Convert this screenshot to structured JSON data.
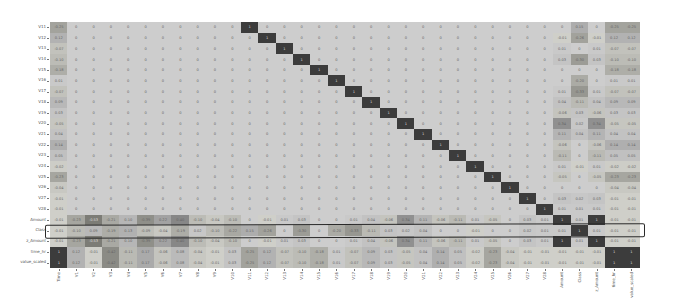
{
  "chart_data": {
    "type": "heatmap",
    "title": "",
    "xlabel": "",
    "ylabel": "",
    "columns": [
      "Time",
      "V1",
      "V2",
      "V3",
      "V4",
      "V5",
      "V6",
      "V7",
      "V8",
      "V9",
      "V10",
      "V11",
      "V12",
      "V13",
      "V14",
      "V15",
      "V16",
      "V17",
      "V18",
      "V19",
      "V20",
      "V21",
      "V22",
      "V23",
      "V24",
      "V25",
      "V26",
      "V27",
      "V28",
      "Amount",
      "Class",
      "z_Amount",
      "time_hr",
      "value_scaled"
    ],
    "rows": [
      "V11",
      "V12",
      "V13",
      "V14",
      "V15",
      "V16",
      "V17",
      "V18",
      "V19",
      "V20",
      "V21",
      "V22",
      "V23",
      "V24",
      "V25",
      "V26",
      "V27",
      "V28",
      "Amount",
      "Class",
      "z_Amount",
      "time_hr",
      "value_scaled"
    ],
    "values": [
      [
        -0.25,
        0,
        0,
        0,
        0,
        0,
        0,
        0,
        0,
        0,
        0,
        1,
        0,
        0,
        0,
        0,
        0,
        0,
        0,
        0,
        0,
        0,
        0,
        0,
        0,
        0,
        0,
        0,
        0,
        0.0,
        0.15,
        0.0,
        -0.25,
        -0.25
      ],
      [
        0.12,
        0,
        0,
        0,
        0,
        0,
        0,
        0,
        0,
        0,
        0,
        0,
        1,
        0,
        0,
        0,
        0,
        0,
        0,
        0,
        0,
        0,
        0,
        0,
        0,
        0,
        0,
        0,
        0,
        -0.01,
        -0.26,
        -0.01,
        0.12,
        0.12
      ],
      [
        -0.07,
        0,
        0,
        0,
        0,
        0,
        0,
        0,
        0,
        0,
        0,
        0,
        0,
        1,
        0,
        0,
        0,
        0,
        0,
        0,
        0,
        0,
        0,
        0,
        0,
        0,
        0,
        0,
        0,
        0.01,
        0.0,
        0.01,
        -0.07,
        -0.07
      ],
      [
        -0.1,
        0,
        0,
        0,
        0,
        0,
        0,
        0,
        0,
        0,
        0,
        0,
        0,
        0,
        1,
        0,
        0,
        0,
        0,
        0,
        0,
        0,
        0,
        0,
        0,
        0,
        0,
        0,
        0,
        0.03,
        -0.3,
        0.03,
        -0.1,
        -0.1
      ],
      [
        -0.18,
        0,
        0,
        0,
        0,
        0,
        0,
        0,
        0,
        0,
        0,
        0,
        0,
        0,
        0,
        1,
        0,
        0,
        0,
        0,
        0,
        0,
        0,
        0,
        0,
        0,
        0,
        0,
        0,
        0.0,
        0.0,
        0.0,
        -0.18,
        -0.18
      ],
      [
        0.01,
        0,
        0,
        0,
        0,
        0,
        0,
        0,
        0,
        0,
        0,
        0,
        0,
        0,
        0,
        0,
        1,
        0,
        0,
        0,
        0,
        0,
        0,
        0,
        0,
        0,
        0,
        0,
        0,
        0.0,
        -0.2,
        0.0,
        0.01,
        0.01
      ],
      [
        -0.07,
        0,
        0,
        0,
        0,
        0,
        0,
        0,
        0,
        0,
        0,
        0,
        0,
        0,
        0,
        0,
        0,
        1,
        0,
        0,
        0,
        0,
        0,
        0,
        0,
        0,
        0,
        0,
        0,
        0.01,
        -0.33,
        0.01,
        -0.07,
        -0.07
      ],
      [
        0.09,
        0,
        0,
        0,
        0,
        0,
        0,
        0,
        0,
        0,
        0,
        0,
        0,
        0,
        0,
        0,
        0,
        0,
        1,
        0,
        0,
        0,
        0,
        0,
        0,
        0,
        0,
        0,
        0,
        0.04,
        -0.11,
        0.04,
        0.09,
        0.09
      ],
      [
        0.03,
        0,
        0,
        0,
        0,
        0,
        0,
        0,
        0,
        0,
        0,
        0,
        0,
        0,
        0,
        0,
        0,
        0,
        0,
        1,
        0,
        0,
        0,
        0,
        0,
        0,
        0,
        0,
        0,
        -0.06,
        0.03,
        -0.06,
        0.03,
        0.03
      ],
      [
        -0.05,
        0,
        0,
        0,
        0,
        0,
        0,
        0,
        0,
        0,
        0,
        0,
        0,
        0,
        0,
        0,
        0,
        0,
        0,
        0,
        1,
        0,
        0,
        0,
        0,
        0,
        0,
        0,
        0,
        0.34,
        0.02,
        0.34,
        -0.05,
        -0.05
      ],
      [
        0.04,
        0,
        0,
        0,
        0,
        0,
        0,
        0,
        0,
        0,
        0,
        0,
        0,
        0,
        0,
        0,
        0,
        0,
        0,
        0,
        0,
        1,
        0,
        0,
        0,
        0,
        0,
        0,
        0,
        0.11,
        0.04,
        0.11,
        0.04,
        0.04
      ],
      [
        0.14,
        0,
        0,
        0,
        0,
        0,
        0,
        0,
        0,
        0,
        0,
        0,
        0,
        0,
        0,
        0,
        0,
        0,
        0,
        0,
        0,
        0,
        1,
        0,
        0,
        0,
        0,
        0,
        0,
        -0.06,
        0.0,
        -0.06,
        0.14,
        0.14
      ],
      [
        0.05,
        0,
        0,
        0,
        0,
        0,
        0,
        0,
        0,
        0,
        0,
        0,
        0,
        0,
        0,
        0,
        0,
        0,
        0,
        0,
        0,
        0,
        0,
        1,
        0,
        0,
        0,
        0,
        0,
        -0.11,
        0.0,
        -0.11,
        0.05,
        0.05
      ],
      [
        -0.02,
        0,
        0,
        0,
        0,
        0,
        0,
        0,
        0,
        0,
        0,
        0,
        0,
        0,
        0,
        0,
        0,
        0,
        0,
        0,
        0,
        0,
        0,
        0,
        1,
        0,
        0,
        0,
        0,
        0.01,
        -0.01,
        0.01,
        -0.02,
        -0.02
      ],
      [
        -0.23,
        0,
        0,
        0,
        0,
        0,
        0,
        0,
        0,
        0,
        0,
        0,
        0,
        0,
        0,
        0,
        0,
        0,
        0,
        0,
        0,
        0,
        0,
        0,
        0,
        1,
        0,
        0,
        0,
        -0.05,
        0.0,
        -0.05,
        -0.23,
        -0.23
      ],
      [
        -0.04,
        0,
        0,
        0,
        0,
        0,
        0,
        0,
        0,
        0,
        0,
        0,
        0,
        0,
        0,
        0,
        0,
        0,
        0,
        0,
        0,
        0,
        0,
        0,
        0,
        0,
        1,
        0,
        0,
        0.0,
        0.0,
        0.0,
        -0.04,
        -0.04
      ],
      [
        -0.01,
        0,
        0,
        0,
        0,
        0,
        0,
        0,
        0,
        0,
        0,
        0,
        0,
        0,
        0,
        0,
        0,
        0,
        0,
        0,
        0,
        0,
        0,
        0,
        0,
        0,
        0,
        1,
        0,
        0.03,
        0.02,
        0.03,
        -0.01,
        -0.01
      ],
      [
        -0.01,
        0,
        0,
        0,
        0,
        0,
        0,
        0,
        0,
        0,
        0,
        0,
        0,
        0,
        0,
        0,
        0,
        0,
        0,
        0,
        0,
        0,
        0,
        0,
        0,
        0,
        0,
        0,
        1,
        0.01,
        0.01,
        0.01,
        -0.01,
        -0.01
      ],
      [
        -0.01,
        -0.23,
        -0.53,
        -0.21,
        0.1,
        -0.39,
        0.22,
        0.4,
        -0.1,
        -0.04,
        -0.1,
        0.0,
        -0.01,
        0.01,
        0.03,
        0.0,
        -0.0,
        0.01,
        0.04,
        -0.06,
        0.34,
        0.11,
        -0.06,
        -0.11,
        0.01,
        -0.05,
        0.0,
        0.03,
        0.01,
        1,
        0.01,
        1.0,
        -0.01,
        -0.01
      ],
      [
        -0.01,
        -0.1,
        0.09,
        -0.19,
        0.13,
        -0.09,
        -0.04,
        -0.19,
        0.02,
        -0.1,
        -0.22,
        0.15,
        -0.26,
        0.0,
        -0.3,
        0.0,
        -0.2,
        -0.33,
        -0.11,
        0.03,
        0.02,
        0.04,
        0.0,
        0.0,
        -0.01,
        0.0,
        0.0,
        0.02,
        0.01,
        0.01,
        1,
        0.01,
        -0.01,
        -0.01
      ],
      [
        -0.01,
        -0.23,
        -0.53,
        -0.21,
        0.1,
        -0.39,
        0.22,
        0.4,
        -0.1,
        -0.04,
        -0.1,
        0.0,
        -0.01,
        0.01,
        0.03,
        0.0,
        -0.0,
        0.01,
        0.04,
        -0.06,
        0.34,
        0.11,
        -0.06,
        -0.11,
        0.01,
        -0.05,
        0.0,
        0.03,
        0.01,
        1.0,
        0.01,
        1,
        -0.01,
        -0.01
      ],
      [
        1.0,
        0.12,
        -0.01,
        -0.42,
        -0.11,
        0.17,
        -0.06,
        0.08,
        -0.04,
        -0.01,
        0.03,
        -0.25,
        0.12,
        -0.07,
        -0.1,
        -0.18,
        0.01,
        -0.07,
        0.09,
        0.03,
        -0.05,
        0.04,
        0.14,
        0.05,
        -0.02,
        -0.23,
        -0.04,
        -0.01,
        -0.01,
        -0.01,
        -0.01,
        -0.01,
        1,
        1.0
      ],
      [
        1.0,
        0.12,
        -0.01,
        -0.42,
        -0.11,
        0.17,
        -0.06,
        0.08,
        -0.04,
        -0.01,
        0.03,
        -0.25,
        0.12,
        -0.07,
        -0.1,
        -0.18,
        0.01,
        -0.07,
        0.09,
        0.03,
        -0.05,
        0.04,
        0.14,
        0.05,
        -0.02,
        -0.23,
        -0.04,
        -0.01,
        -0.01,
        -0.01,
        -0.01,
        -0.01,
        1.0,
        1
      ]
    ],
    "vmin": -1,
    "vmax": 1,
    "colormap": "grayscale",
    "annotations": [
      {
        "type": "outline",
        "row": "Class",
        "description": "hand-drawn rectangle highlighting Class row"
      }
    ],
    "grid": false,
    "legend": "none"
  },
  "layout": {
    "grid_left": 50,
    "grid_top": 22,
    "grid_right": 640,
    "grid_bottom": 268,
    "highlight_color": "#2a2a2a"
  }
}
